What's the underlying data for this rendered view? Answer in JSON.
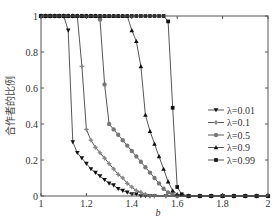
{
  "chart_data": {
    "type": "line",
    "title": "",
    "xlabel": "b",
    "ylabel": "合作者的比例",
    "xlim": [
      1,
      2
    ],
    "ylim": [
      0,
      1
    ],
    "grid": false,
    "legend_position": "lower right (inside)",
    "x_ticks": [
      "1",
      "1.2",
      "1.4",
      "1.6",
      "1.8",
      "2"
    ],
    "y_ticks": [
      "0",
      "0.2",
      "0.4",
      "0.6",
      "0.8",
      "1"
    ],
    "series": [
      {
        "name": "λ=0.01",
        "marker": "triangle-down",
        "color": "#111111",
        "x": [
          1.0,
          1.02,
          1.04,
          1.06,
          1.08,
          1.1,
          1.12,
          1.14,
          1.16,
          1.18,
          1.2,
          1.22,
          1.24,
          1.26,
          1.28,
          1.3,
          1.32,
          1.34,
          1.36,
          1.38,
          1.4,
          1.42,
          1.44,
          1.46,
          1.48,
          1.5,
          1.55,
          1.6,
          1.65,
          1.7,
          1.75,
          1.8,
          1.85,
          1.9,
          1.95,
          2.0
        ],
        "y": [
          1,
          1,
          1,
          1,
          1,
          1,
          0.92,
          0.3,
          0.24,
          0.21,
          0.18,
          0.15,
          0.13,
          0.11,
          0.09,
          0.07,
          0.06,
          0.04,
          0.03,
          0.02,
          0.01,
          0.01,
          0,
          0,
          0,
          0,
          0,
          0,
          0,
          0,
          0,
          0,
          0,
          0,
          0,
          0
        ]
      },
      {
        "name": "λ=0.1",
        "marker": "plus",
        "color": "#888888",
        "x": [
          1.0,
          1.02,
          1.04,
          1.06,
          1.08,
          1.1,
          1.12,
          1.14,
          1.16,
          1.18,
          1.2,
          1.22,
          1.24,
          1.26,
          1.28,
          1.3,
          1.32,
          1.34,
          1.36,
          1.38,
          1.4,
          1.42,
          1.44,
          1.46,
          1.48,
          1.5,
          1.55,
          1.6,
          1.65,
          1.7,
          1.75,
          1.8,
          1.85,
          1.9,
          1.95,
          2.0
        ],
        "y": [
          1,
          1,
          1,
          1,
          1,
          1,
          1,
          1,
          1,
          0.72,
          0.37,
          0.31,
          0.27,
          0.24,
          0.21,
          0.18,
          0.15,
          0.12,
          0.1,
          0.07,
          0.05,
          0.03,
          0.02,
          0.01,
          0,
          0,
          0,
          0,
          0,
          0,
          0,
          0,
          0,
          0,
          0,
          0
        ]
      },
      {
        "name": "λ=0.5",
        "marker": "circle",
        "color": "#777777",
        "x": [
          1.0,
          1.02,
          1.04,
          1.06,
          1.08,
          1.1,
          1.12,
          1.14,
          1.16,
          1.18,
          1.2,
          1.22,
          1.24,
          1.26,
          1.28,
          1.3,
          1.32,
          1.34,
          1.36,
          1.38,
          1.4,
          1.42,
          1.44,
          1.46,
          1.48,
          1.5,
          1.52,
          1.54,
          1.56,
          1.58,
          1.6,
          1.65,
          1.7,
          1.75,
          1.8,
          1.85,
          1.9,
          1.95,
          2.0
        ],
        "y": [
          1,
          1,
          1,
          1,
          1,
          1,
          1,
          1,
          1,
          1,
          1,
          1,
          1,
          0.98,
          0.62,
          0.4,
          0.37,
          0.34,
          0.31,
          0.28,
          0.25,
          0.22,
          0.19,
          0.16,
          0.13,
          0.1,
          0.07,
          0.04,
          0.02,
          0.01,
          0,
          0,
          0,
          0,
          0,
          0,
          0,
          0,
          0
        ]
      },
      {
        "name": "λ=0.9",
        "marker": "triangle-up",
        "color": "#111111",
        "x": [
          1.0,
          1.02,
          1.04,
          1.06,
          1.08,
          1.1,
          1.12,
          1.14,
          1.16,
          1.18,
          1.2,
          1.22,
          1.24,
          1.26,
          1.28,
          1.3,
          1.32,
          1.34,
          1.36,
          1.38,
          1.4,
          1.42,
          1.44,
          1.46,
          1.48,
          1.5,
          1.52,
          1.54,
          1.56,
          1.58,
          1.6,
          1.65,
          1.7,
          1.75,
          1.8,
          1.85,
          1.9,
          1.95,
          2.0
        ],
        "y": [
          1,
          1,
          1,
          1,
          1,
          1,
          1,
          1,
          1,
          1,
          1,
          1,
          1,
          1,
          1,
          1,
          1,
          1,
          1,
          1,
          0.92,
          0.86,
          0.72,
          0.45,
          0.36,
          0.29,
          0.22,
          0.15,
          0.08,
          0.03,
          0.01,
          0,
          0,
          0,
          0,
          0,
          0,
          0,
          0
        ]
      },
      {
        "name": "λ=0.99",
        "marker": "square",
        "color": "#111111",
        "x": [
          1.0,
          1.02,
          1.04,
          1.06,
          1.08,
          1.1,
          1.12,
          1.14,
          1.16,
          1.18,
          1.2,
          1.22,
          1.24,
          1.26,
          1.28,
          1.3,
          1.32,
          1.34,
          1.36,
          1.38,
          1.4,
          1.42,
          1.44,
          1.46,
          1.48,
          1.5,
          1.52,
          1.54,
          1.56,
          1.58,
          1.6,
          1.62,
          1.65,
          1.7,
          1.75,
          1.8,
          1.85,
          1.9,
          1.95,
          2.0
        ],
        "y": [
          1,
          1,
          1,
          1,
          1,
          1,
          1,
          1,
          1,
          1,
          1,
          1,
          1,
          1,
          1,
          1,
          1,
          1,
          1,
          1,
          1,
          1,
          1,
          1,
          1,
          1,
          1,
          1,
          0.97,
          0.49,
          0.05,
          0.01,
          0,
          0,
          0,
          0,
          0,
          0,
          0,
          0
        ]
      }
    ]
  }
}
